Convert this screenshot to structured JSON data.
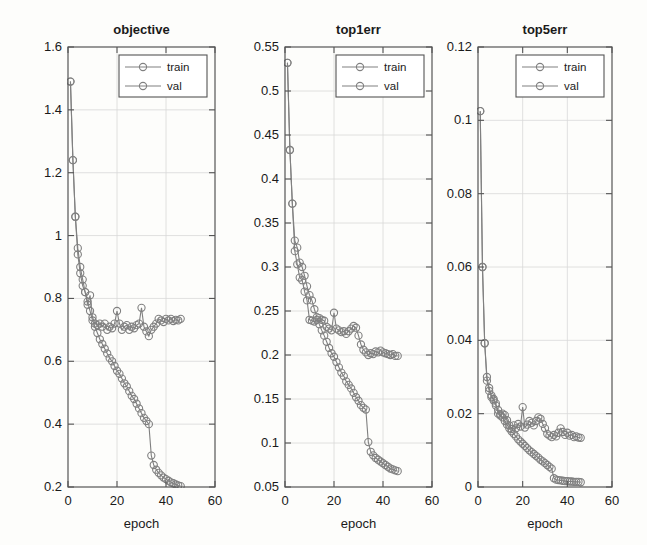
{
  "figure": {
    "background_color": "#fdfdfb",
    "axis_color": "#555555",
    "grid_color": "#d8d8d8",
    "series_color": "#808080",
    "text_color": "#1a1a1a",
    "xlabel": "epoch",
    "legend_entries": [
      "train",
      "val"
    ]
  },
  "chart_data": [
    {
      "type": "line",
      "title": "objective",
      "xlabel": "epoch",
      "ylabel": "",
      "xlim": [
        0,
        60
      ],
      "ylim": [
        0.2,
        1.6
      ],
      "xticks": [
        0,
        20,
        40,
        60
      ],
      "yticks": [
        0.2,
        0.4,
        0.6,
        0.8,
        1,
        1.2,
        1.4,
        1.6
      ],
      "ytick_labels": [
        "0.2",
        "0.4",
        "0.6",
        "0.8",
        "1",
        "1.2",
        "1.4",
        "1.6"
      ],
      "xtick_labels": [
        "0",
        "20",
        "40",
        "60"
      ],
      "grid": true,
      "legend_position": "top-right",
      "series": [
        {
          "name": "train",
          "x": [
            1,
            2,
            3,
            4,
            5,
            6,
            7,
            8,
            9,
            10,
            11,
            12,
            13,
            14,
            15,
            16,
            17,
            18,
            19,
            20,
            21,
            22,
            23,
            24,
            25,
            26,
            27,
            28,
            29,
            30,
            31,
            32,
            33,
            34,
            35,
            36,
            37,
            38,
            39,
            40,
            41,
            42,
            43,
            44,
            45,
            46
          ],
          "values": [
            1.49,
            1.24,
            1.06,
            0.96,
            0.9,
            0.86,
            0.82,
            0.79,
            0.76,
            0.73,
            0.71,
            0.69,
            0.67,
            0.655,
            0.64,
            0.625,
            0.61,
            0.6,
            0.585,
            0.57,
            0.56,
            0.545,
            0.53,
            0.52,
            0.505,
            0.49,
            0.48,
            0.465,
            0.45,
            0.435,
            0.42,
            0.41,
            0.4,
            0.3,
            0.27,
            0.255,
            0.245,
            0.237,
            0.23,
            0.225,
            0.22,
            0.215,
            0.212,
            0.208,
            0.205,
            0.203
          ]
        },
        {
          "name": "val",
          "x": [
            1,
            2,
            3,
            4,
            5,
            6,
            7,
            8,
            9,
            10,
            11,
            12,
            13,
            14,
            15,
            16,
            17,
            18,
            19,
            20,
            21,
            22,
            23,
            24,
            25,
            26,
            27,
            28,
            29,
            30,
            31,
            32,
            33,
            34,
            35,
            36,
            37,
            38,
            39,
            40,
            41,
            42,
            43,
            44,
            45,
            46
          ],
          "values": [
            1.49,
            1.24,
            1.06,
            0.94,
            0.88,
            0.84,
            0.82,
            0.78,
            0.81,
            0.74,
            0.72,
            0.715,
            0.72,
            0.71,
            0.72,
            0.7,
            0.71,
            0.705,
            0.72,
            0.76,
            0.72,
            0.7,
            0.71,
            0.715,
            0.7,
            0.71,
            0.705,
            0.715,
            0.72,
            0.77,
            0.71,
            0.695,
            0.68,
            0.7,
            0.71,
            0.72,
            0.735,
            0.73,
            0.725,
            0.735,
            0.73,
            0.735,
            0.728,
            0.732,
            0.73,
            0.735
          ]
        }
      ]
    },
    {
      "type": "line",
      "title": "top1err",
      "xlabel": "epoch",
      "ylabel": "",
      "xlim": [
        0,
        60
      ],
      "ylim": [
        0.05,
        0.55
      ],
      "xticks": [
        0,
        20,
        40,
        60
      ],
      "yticks": [
        0.05,
        0.1,
        0.15,
        0.2,
        0.25,
        0.3,
        0.35,
        0.4,
        0.45,
        0.5,
        0.55
      ],
      "ytick_labels": [
        "0.05",
        "0.1",
        "0.15",
        "0.2",
        "0.25",
        "0.3",
        "0.35",
        "0.4",
        "0.45",
        "0.5",
        "0.55"
      ],
      "xtick_labels": [
        "0",
        "20",
        "40",
        "60"
      ],
      "grid": true,
      "legend_position": "top-right",
      "series": [
        {
          "name": "train",
          "x": [
            1,
            2,
            3,
            4,
            5,
            6,
            7,
            8,
            9,
            10,
            11,
            12,
            13,
            14,
            15,
            16,
            17,
            18,
            19,
            20,
            21,
            22,
            23,
            24,
            25,
            26,
            27,
            28,
            29,
            30,
            31,
            32,
            33,
            34,
            35,
            36,
            37,
            38,
            39,
            40,
            41,
            42,
            43,
            44,
            45,
            46
          ],
          "values": [
            0.532,
            0.433,
            0.372,
            0.33,
            0.322,
            0.305,
            0.3,
            0.29,
            0.278,
            0.268,
            0.262,
            0.252,
            0.243,
            0.235,
            0.228,
            0.222,
            0.215,
            0.208,
            0.202,
            0.198,
            0.192,
            0.186,
            0.18,
            0.176,
            0.17,
            0.166,
            0.162,
            0.157,
            0.152,
            0.148,
            0.143,
            0.14,
            0.138,
            0.101,
            0.09,
            0.086,
            0.083,
            0.081,
            0.079,
            0.077,
            0.075,
            0.073,
            0.071,
            0.07,
            0.069,
            0.068
          ]
        },
        {
          "name": "val",
          "x": [
            1,
            2,
            3,
            4,
            5,
            6,
            7,
            8,
            9,
            10,
            11,
            12,
            13,
            14,
            15,
            16,
            17,
            18,
            19,
            20,
            21,
            22,
            23,
            24,
            25,
            26,
            27,
            28,
            29,
            30,
            31,
            32,
            33,
            34,
            35,
            36,
            37,
            38,
            39,
            40,
            41,
            42,
            43,
            44,
            45,
            46
          ],
          "values": [
            0.532,
            0.433,
            0.372,
            0.318,
            0.303,
            0.288,
            0.285,
            0.272,
            0.262,
            0.24,
            0.239,
            0.238,
            0.24,
            0.242,
            0.24,
            0.239,
            0.232,
            0.23,
            0.228,
            0.248,
            0.23,
            0.228,
            0.226,
            0.227,
            0.224,
            0.227,
            0.23,
            0.233,
            0.231,
            0.222,
            0.212,
            0.206,
            0.203,
            0.2,
            0.202,
            0.201,
            0.204,
            0.203,
            0.205,
            0.203,
            0.202,
            0.201,
            0.2,
            0.201,
            0.199,
            0.199
          ]
        }
      ]
    },
    {
      "type": "line",
      "title": "top5err",
      "xlabel": "epoch",
      "ylabel": "",
      "xlim": [
        0,
        60
      ],
      "ylim": [
        0,
        0.12
      ],
      "xticks": [
        0,
        20,
        40,
        60
      ],
      "yticks": [
        0,
        0.02,
        0.04,
        0.06,
        0.08,
        0.1,
        0.12
      ],
      "ytick_labels": [
        "0",
        "0.02",
        "0.04",
        "0.06",
        "0.08",
        "0.1",
        "0.12"
      ],
      "xtick_labels": [
        "0",
        "20",
        "40",
        "60"
      ],
      "grid": true,
      "legend_position": "top-right",
      "series": [
        {
          "name": "train",
          "x": [
            1,
            2,
            3,
            4,
            5,
            6,
            7,
            8,
            9,
            10,
            11,
            12,
            13,
            14,
            15,
            16,
            17,
            18,
            19,
            20,
            21,
            22,
            23,
            24,
            25,
            26,
            27,
            28,
            29,
            30,
            31,
            32,
            33,
            34,
            35,
            36,
            37,
            38,
            39,
            40,
            41,
            42,
            43,
            44,
            45,
            46
          ],
          "values": [
            0.1025,
            0.06,
            0.0392,
            0.03,
            0.027,
            0.025,
            0.0236,
            0.0222,
            0.021,
            0.0198,
            0.019,
            0.018,
            0.017,
            0.016,
            0.0152,
            0.0145,
            0.0138,
            0.013,
            0.0124,
            0.0118,
            0.0112,
            0.0106,
            0.01,
            0.0095,
            0.009,
            0.0085,
            0.008,
            0.0074,
            0.007,
            0.0065,
            0.006,
            0.0055,
            0.005,
            0.0024,
            0.002,
            0.0019,
            0.0018,
            0.0017,
            0.0016,
            0.0016,
            0.0015,
            0.0015,
            0.0014,
            0.0014,
            0.0014,
            0.0013
          ]
        },
        {
          "name": "val",
          "x": [
            1,
            2,
            3,
            4,
            5,
            6,
            7,
            8,
            9,
            10,
            11,
            12,
            13,
            14,
            15,
            16,
            17,
            18,
            19,
            20,
            21,
            22,
            23,
            24,
            25,
            26,
            27,
            28,
            29,
            30,
            31,
            32,
            33,
            34,
            35,
            36,
            37,
            38,
            39,
            40,
            41,
            42,
            43,
            44,
            45,
            46
          ],
          "values": [
            0.1025,
            0.06,
            0.0392,
            0.029,
            0.0262,
            0.0245,
            0.024,
            0.0228,
            0.02,
            0.0195,
            0.02,
            0.0196,
            0.0182,
            0.0168,
            0.0158,
            0.0168,
            0.016,
            0.0172,
            0.0165,
            0.0218,
            0.0162,
            0.017,
            0.018,
            0.0175,
            0.0168,
            0.018,
            0.019,
            0.0186,
            0.0172,
            0.016,
            0.0145,
            0.014,
            0.0136,
            0.0142,
            0.0138,
            0.0148,
            0.016,
            0.015,
            0.0142,
            0.0148,
            0.014,
            0.0142,
            0.0136,
            0.0138,
            0.0135,
            0.0134
          ]
        }
      ]
    }
  ]
}
